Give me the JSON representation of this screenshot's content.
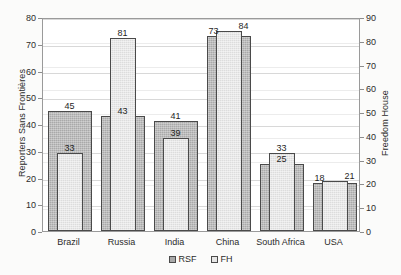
{
  "chart_data": {
    "type": "bar",
    "title": "",
    "categories": [
      "Brazil",
      "Russia",
      "India",
      "China",
      "South Africa",
      "USA"
    ],
    "series": [
      {
        "name": "RSF",
        "axis": "left",
        "axis_label": "Reporters Sans Frontières",
        "values": [
          45,
          43,
          41,
          73,
          25,
          18
        ],
        "color": "#a9a9a9"
      },
      {
        "name": "FH",
        "axis": "right",
        "axis_label": "Freedom House",
        "values": [
          33,
          81,
          39,
          84,
          33,
          21
        ],
        "color": "#dcdcdc"
      }
    ],
    "xlabel": "",
    "ylabel": "Reporters Sans Frontières",
    "y2label": "Freedom House",
    "ylim": [
      0,
      80
    ],
    "y2lim": [
      0,
      90
    ],
    "yticks": [
      0,
      10,
      20,
      30,
      40,
      50,
      60,
      70,
      80
    ],
    "y2ticks": [
      0,
      10,
      20,
      30,
      40,
      50,
      60,
      70,
      80,
      90
    ],
    "grid": true,
    "legend_position": "bottom-center",
    "legend_entries": [
      "RSF",
      "FH"
    ]
  },
  "axes": {
    "left": {
      "title": "Reporters Sans Frontières",
      "ticks": [
        "0",
        "10",
        "20",
        "30",
        "40",
        "50",
        "60",
        "70",
        "80"
      ]
    },
    "right": {
      "title": "Freedom House",
      "ticks": [
        "0",
        "10",
        "20",
        "30",
        "40",
        "50",
        "60",
        "70",
        "80",
        "90"
      ]
    }
  },
  "categories": [
    "Brazil",
    "Russia",
    "India",
    "China",
    "South Africa",
    "USA"
  ],
  "labels": {
    "rsf": [
      "45",
      "43",
      "41",
      "73",
      "25",
      "18"
    ],
    "fh": [
      "33",
      "81",
      "39",
      "84",
      "33",
      "21"
    ]
  },
  "legend": {
    "items": [
      {
        "label": "RSF",
        "color": "#a9a9a9"
      },
      {
        "label": "FH",
        "color": "#e6e6e6"
      }
    ]
  }
}
